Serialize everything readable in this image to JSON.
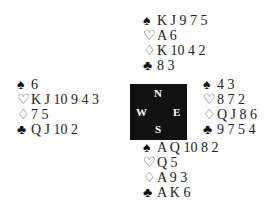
{
  "deal": {
    "north": {
      "spades": "K J 9 7 5",
      "hearts": "A 6",
      "diamonds": "K 10 4 2",
      "clubs": "8 3"
    },
    "west": {
      "spades": "6",
      "hearts": "K J 10 9 4 3",
      "diamonds": "7 5",
      "clubs": "Q J 10 2"
    },
    "east": {
      "spades": "4 3",
      "hearts": "8 7 2",
      "diamonds": "Q J 8 6",
      "clubs": "9 7 5 4"
    },
    "south": {
      "spades": "A Q 10 8 2",
      "hearts": "Q 5",
      "diamonds": "A 9 3",
      "clubs": "A K 6"
    }
  },
  "compass": {
    "n": "N",
    "e": "E",
    "s": "S",
    "w": "W"
  },
  "suits": {
    "spades": "♠",
    "hearts": "♡",
    "diamonds": "♢",
    "clubs": "♣"
  }
}
